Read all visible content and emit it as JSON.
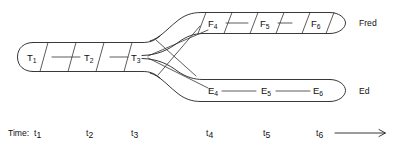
{
  "diagram": {
    "stroke_color": "#222222",
    "background_color": "#ffffff",
    "trunk": {
      "name": "T",
      "stage_labels": [
        "T",
        "T",
        "T"
      ],
      "stage_subscripts": [
        "1",
        "2",
        "3"
      ],
      "stages": [
        {
          "label": "T",
          "sub": "1"
        },
        {
          "label": "T",
          "sub": "2"
        },
        {
          "label": "T",
          "sub": "3"
        }
      ]
    },
    "upper_branch": {
      "person_label": "Fred",
      "stages": [
        {
          "label": "F",
          "sub": "4"
        },
        {
          "label": "F",
          "sub": "5"
        },
        {
          "label": "F",
          "sub": "6"
        }
      ]
    },
    "lower_branch": {
      "person_label": "Ed",
      "stages": [
        {
          "label": "E",
          "sub": "4"
        },
        {
          "label": "E",
          "sub": "5"
        },
        {
          "label": "E",
          "sub": "6"
        }
      ]
    },
    "time_axis": {
      "caption": "Time:",
      "ticks": [
        {
          "label": "t",
          "sub": "1"
        },
        {
          "label": "t",
          "sub": "2"
        },
        {
          "label": "t",
          "sub": "3"
        },
        {
          "label": "t",
          "sub": "4"
        },
        {
          "label": "t",
          "sub": "5"
        },
        {
          "label": "t",
          "sub": "6"
        }
      ],
      "arrow": "arrow-right-icon"
    }
  }
}
